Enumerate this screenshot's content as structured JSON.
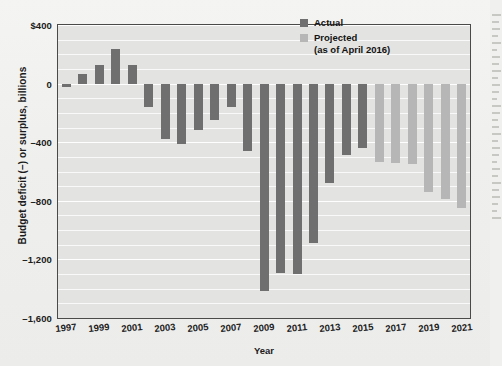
{
  "chart_data": {
    "type": "bar",
    "title": "",
    "xlabel": "Year",
    "ylabel": "Budget deficit (–) or surplus, billions",
    "ylim": [
      -1600,
      400
    ],
    "ytick_labels": [
      "$400",
      "0",
      "–400",
      "–800",
      "–1,200",
      "–1,600"
    ],
    "ytick_values": [
      400,
      0,
      -400,
      -800,
      -1200,
      -1600
    ],
    "xtick_labels": [
      "1997",
      "1999",
      "2001",
      "2003",
      "2005",
      "2007",
      "2009",
      "2011",
      "2013",
      "2015",
      "2017",
      "2019",
      "2021"
    ],
    "grid": true,
    "legend_position": "top-right",
    "categories": [
      1997,
      1998,
      1999,
      2000,
      2001,
      2002,
      2003,
      2004,
      2005,
      2006,
      2007,
      2008,
      2009,
      2010,
      2011,
      2012,
      2013,
      2014,
      2015,
      2016,
      2017,
      2018,
      2019,
      2020,
      2021
    ],
    "values": [
      -22,
      69,
      126,
      236,
      128,
      -158,
      -378,
      -413,
      -318,
      -248,
      -161,
      -459,
      -1413,
      -1294,
      -1300,
      -1087,
      -680,
      -485,
      -438,
      -534,
      -544,
      -548,
      -740,
      -790,
      -850
    ],
    "series_kind": [
      "actual",
      "actual",
      "actual",
      "actual",
      "actual",
      "actual",
      "actual",
      "actual",
      "actual",
      "actual",
      "actual",
      "actual",
      "actual",
      "actual",
      "actual",
      "actual",
      "actual",
      "actual",
      "actual",
      "projected",
      "projected",
      "projected",
      "projected",
      "projected",
      "projected"
    ],
    "colors": {
      "actual": "#6f6f6f",
      "projected": "#b6b6b6"
    }
  },
  "legend": {
    "actual_label": "Actual",
    "projected_label": "Projected",
    "projected_sub": "(as of April 2016)"
  }
}
